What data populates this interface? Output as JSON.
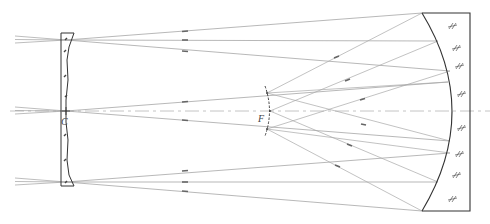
{
  "diagram": {
    "type": "Schmidt camera ray diagram",
    "labels": {
      "corrector_center": "C",
      "focal_surface": "F"
    },
    "components": [
      {
        "name": "corrector-plate",
        "label": "C"
      },
      {
        "name": "focal-surface",
        "label": "F"
      },
      {
        "name": "spherical-mirror"
      }
    ],
    "ray_bundles": 3,
    "colors": {
      "line": "#333333",
      "ray": "#9a9a9a",
      "axis": "#b0b0b0"
    }
  }
}
